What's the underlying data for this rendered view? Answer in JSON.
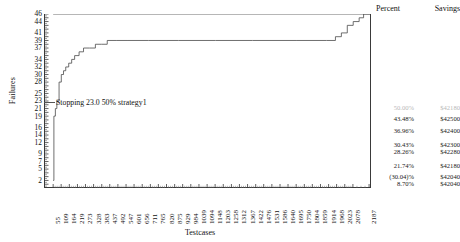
{
  "chart_data": {
    "type": "line",
    "title": "",
    "xlabel": "Testcases",
    "ylabel": "Failures",
    "grid": false,
    "legend_position": "right",
    "xlim": [
      0,
      2200
    ],
    "ylim": [
      0,
      46
    ],
    "y_ticklabels": [
      "46",
      "44",
      "41",
      "39",
      "37",
      "34",
      "32",
      "30",
      "28",
      "25",
      "23",
      "21",
      "19",
      "16",
      "14",
      "12",
      "9",
      "7",
      "5",
      "2"
    ],
    "x_ticklabels": [
      "55",
      "109",
      "164",
      "219",
      "273",
      "328",
      "383",
      "437",
      "492",
      "547",
      "601",
      "656",
      "711",
      "765",
      "820",
      "875",
      "929",
      "984",
      "1039",
      "1094",
      "1148",
      "1203",
      "1258",
      "1312",
      "1367",
      "1422",
      "1476",
      "1531",
      "1586",
      "1640",
      "1695",
      "1750",
      "1804",
      "1859",
      "1914",
      "1968",
      "2023",
      "2078",
      "2187"
    ],
    "series": [
      {
        "name": "total-failures-reference",
        "style": "horizontal-line",
        "x": [
          55,
          2187
        ],
        "values": [
          46,
          46
        ]
      },
      {
        "name": "cumulative-failures",
        "style": "step",
        "x": [
          55,
          60,
          70,
          80,
          95,
          110,
          125,
          140,
          160,
          180,
          200,
          230,
          260,
          300,
          340,
          380,
          420,
          480,
          560,
          700,
          900,
          1150,
          1400,
          1700,
          1900,
          1960,
          2000,
          2040,
          2080,
          2120,
          2150,
          2187
        ],
        "values": [
          2,
          19,
          21,
          23,
          28,
          30,
          31,
          32,
          33,
          34,
          35,
          36,
          37,
          37,
          38,
          38,
          39,
          39,
          39,
          39,
          39,
          39,
          39,
          39,
          39,
          40,
          41,
          43,
          44,
          45,
          46,
          46
        ]
      }
    ],
    "annotations": [
      {
        "text": "Stopping 23.0 50% strategy1",
        "x": 55,
        "y": 23
      }
    ]
  },
  "axis": {
    "y_title": "Failures",
    "x_title": "Testcases"
  },
  "savings_table": {
    "header": {
      "percent": "Percent",
      "savings": "Savings"
    },
    "rows": [
      {
        "percent": "50.00%",
        "savings": "$42180",
        "faint": true
      },
      {
        "percent": "43.48%",
        "savings": "$42500",
        "faint": false
      },
      {
        "percent": "36.96%",
        "savings": "$42400",
        "faint": false
      },
      {
        "percent": "30.43%",
        "savings": "$42300",
        "faint": false
      },
      {
        "percent": "28.26%",
        "savings": "$42280",
        "faint": false
      },
      {
        "percent": "21.74%",
        "savings": "$42180",
        "faint": false
      },
      {
        "percent": "(30.04)%",
        "savings": "$42040",
        "faint": false
      },
      {
        "percent": "8.70%",
        "savings": "$42040",
        "faint": false
      }
    ]
  }
}
